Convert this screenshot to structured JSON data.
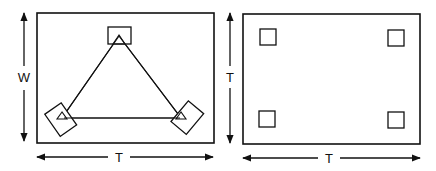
{
  "figure": {
    "left_panel": {
      "vertical_dimension_label": "W",
      "horizontal_dimension_label": "T",
      "description": "Rectangular plate with three squares arranged at vertices of a triangle"
    },
    "right_panel": {
      "vertical_dimension_label": "T",
      "horizontal_dimension_label": "T",
      "description": "Rectangular plate with four squares at corners"
    }
  },
  "colors": {
    "stroke": "#111111",
    "background": "#ffffff"
  }
}
